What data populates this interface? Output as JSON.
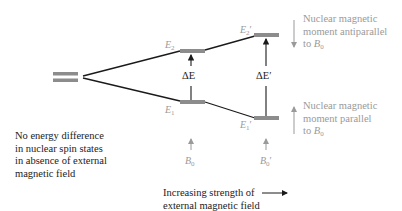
{
  "diagram": {
    "colors": {
      "line": "#1a1a1a",
      "level_bar": "#8c8c8c",
      "muted_text": "#9a9a9a",
      "text": "#222222"
    },
    "levels": {
      "E2": {
        "symbol": "E",
        "sub": "2",
        "prime": ""
      },
      "E1": {
        "symbol": "E",
        "sub": "1",
        "prime": ""
      },
      "E2p": {
        "symbol": "E",
        "sub": "2",
        "prime": "′"
      },
      "E1p": {
        "symbol": "E",
        "sub": "1",
        "prime": "′"
      }
    },
    "gaps": {
      "dE": "ΔE",
      "dEp": "ΔE′"
    },
    "fields": {
      "B0": {
        "symbol": "B",
        "sub": "0",
        "prime": ""
      },
      "B0p": {
        "symbol": "B",
        "sub": "0",
        "prime": "′"
      }
    },
    "annotations": {
      "antiparallel": [
        "Nuclear magnetic",
        "moment antiparallel",
        "to "
      ],
      "antiparallel_field": {
        "symbol": "B",
        "sub": "0"
      },
      "parallel": [
        "Nuclear magnetic",
        "moment parallel",
        "to "
      ],
      "parallel_field": {
        "symbol": "B",
        "sub": "0"
      },
      "no_field": [
        "No energy difference",
        "in nuclear spin states",
        "in absence of external",
        "magnetic field"
      ],
      "increasing": [
        "Increasing strength of",
        "external magnetic field"
      ]
    }
  }
}
